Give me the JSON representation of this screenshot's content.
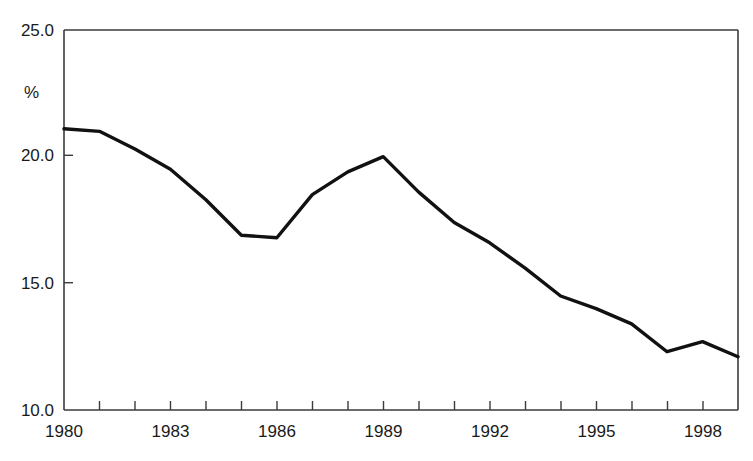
{
  "chart_data": {
    "type": "line",
    "title": "",
    "subtitle": "",
    "xlabel": "",
    "ylabel": "%",
    "ylim": [
      10.0,
      25.0
    ],
    "xlim": [
      1980,
      1999
    ],
    "grid": false,
    "legend": "none",
    "y_ticks": [
      "10.0",
      "15.0",
      "20.0",
      "25.0"
    ],
    "y_tick_values": [
      10.0,
      15.0,
      20.0,
      25.0
    ],
    "x_ticks": [
      "1980",
      "1983",
      "1986",
      "1989",
      "1992",
      "1995",
      "1998"
    ],
    "x_tick_values": [
      1980,
      1983,
      1986,
      1989,
      1992,
      1995,
      1998
    ],
    "x_minor_ticks": [
      1981,
      1982,
      1984,
      1985,
      1987,
      1988,
      1990,
      1991,
      1993,
      1994,
      1996,
      1997,
      1999
    ],
    "x": [
      1980,
      1981,
      1982,
      1983,
      1984,
      1985,
      1986,
      1987,
      1988,
      1989,
      1990,
      1991,
      1992,
      1993,
      1994,
      1995,
      1996,
      1997,
      1998,
      1999
    ],
    "values": [
      21.1,
      21.0,
      20.3,
      19.5,
      18.3,
      16.9,
      16.8,
      18.5,
      19.4,
      20.0,
      18.6,
      17.4,
      16.6,
      15.6,
      14.5,
      14.0,
      13.4,
      12.3,
      12.7,
      12.1
    ],
    "series": [
      {
        "name": "percent",
        "values": [
          21.1,
          21.0,
          20.3,
          19.5,
          18.3,
          16.9,
          16.8,
          18.5,
          19.4,
          20.0,
          18.6,
          17.4,
          16.6,
          15.6,
          14.5,
          14.0,
          13.4,
          12.3,
          12.7,
          12.1
        ],
        "color": "#111111"
      }
    ],
    "annotations": []
  },
  "axes": {
    "y_axis_label": "%",
    "y_tick_labels": [
      "25.0",
      "20.0",
      "15.0",
      "10.0"
    ],
    "x_tick_labels": [
      "1980",
      "1983",
      "1986",
      "1989",
      "1992",
      "1995",
      "1998"
    ]
  },
  "colors": {
    "line": "#111111",
    "axis": "#3b3b3b",
    "background": "#ffffff",
    "text": "#1a1a1a"
  }
}
